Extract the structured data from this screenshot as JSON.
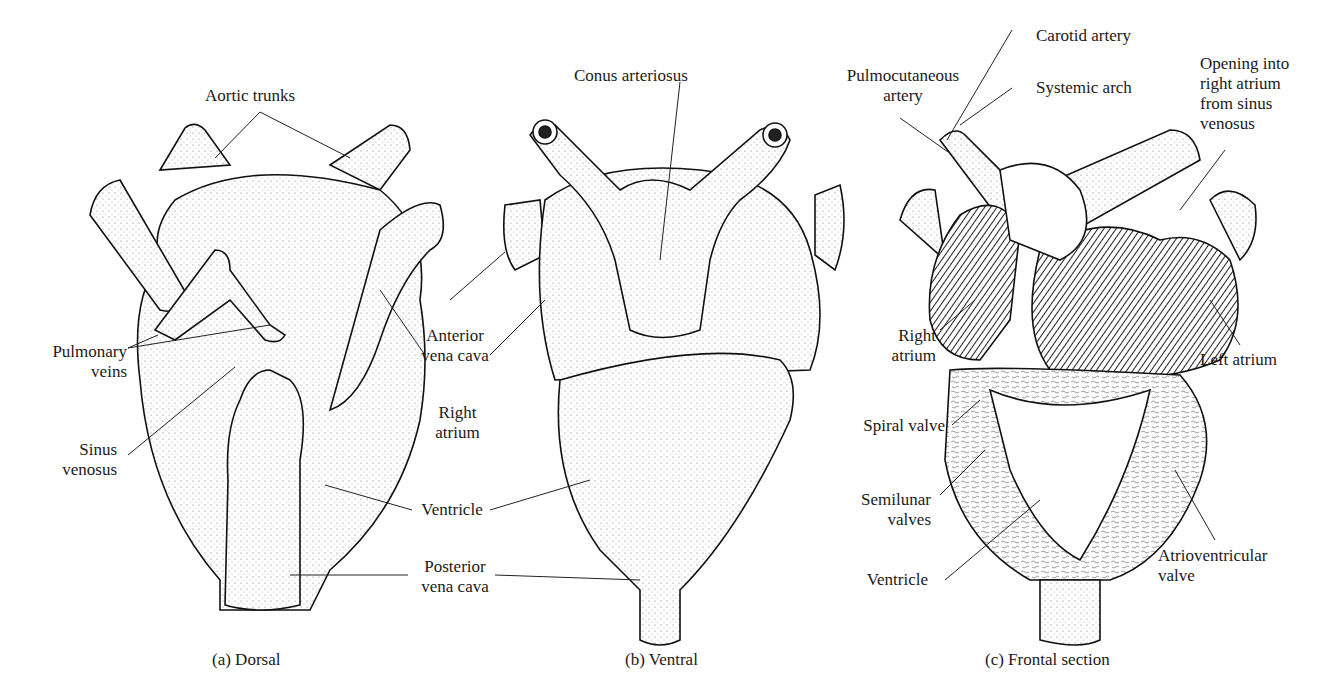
{
  "figure": {
    "panels": [
      {
        "id": "a",
        "caption": "(a) Dorsal",
        "labels": {
          "aortic_trunks": "Aortic trunks",
          "pulmonary_veins": "Pulmonary\nveins",
          "sinus_venosus": "Sinus\nvenosus"
        }
      },
      {
        "id": "b",
        "caption": "(b) Ventral",
        "labels": {
          "conus_arteriosus": "Conus arteriosus"
        }
      },
      {
        "id": "c",
        "caption": "(c) Frontal section",
        "labels": {
          "carotid_artery": "Carotid artery",
          "pulmocutaneous_artery": "Pulmocutaneous\nartery",
          "systemic_arch": "Systemic arch",
          "opening": "Opening into\nright atrium\nfrom sinus\nvenosus",
          "right_atrium": "Right\natrium",
          "left_atrium": "Left atrium",
          "spiral_valve": "Spiral valve",
          "semilunar_valves": "Semilunar\nvalves",
          "ventricle": "Ventricle",
          "atrioventricular_valve": "Atrioventricular\nvalve"
        }
      }
    ],
    "shared_labels": {
      "anterior_vena_cava": "Anterior\nvena cava",
      "right_atrium": "Right\natrium",
      "ventricle": "Ventricle",
      "posterior_vena_cava": "Posterior\nvena cava"
    }
  }
}
